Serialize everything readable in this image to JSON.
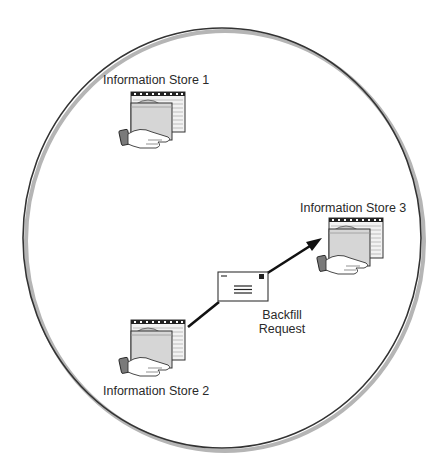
{
  "diagram": {
    "boundary": {
      "shape": "circle",
      "stroke_color": "#333333",
      "shadow_color": "#b5b5b5"
    },
    "nodes": [
      {
        "id": "store1",
        "label": "Information Store 1",
        "icon": "information-store-icon"
      },
      {
        "id": "store2",
        "label": "Information Store 2",
        "icon": "information-store-icon"
      },
      {
        "id": "store3",
        "label": "Information Store 3",
        "icon": "information-store-icon"
      }
    ],
    "edges": [
      {
        "from": "store2",
        "to": "store3",
        "directed": true,
        "message_icon": "envelope-icon",
        "label_line1": "Backfill",
        "label_line2": "Request"
      }
    ],
    "colors": {
      "line": "#111111",
      "icon_fill": "#d8d8d8",
      "icon_dark": "#222222",
      "hand_fill": "#7a7a7a",
      "text": "#2a2a2a"
    }
  }
}
